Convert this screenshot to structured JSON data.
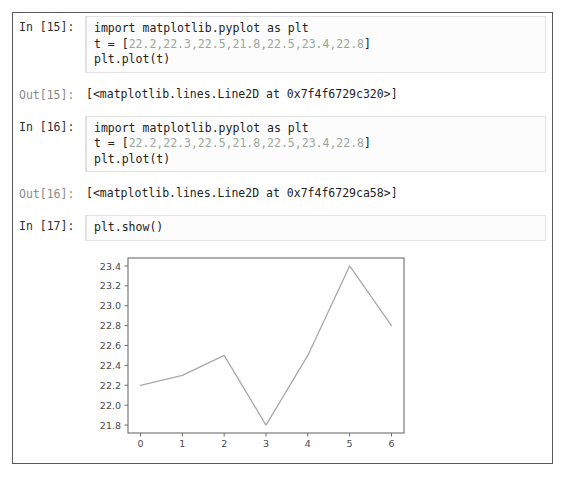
{
  "notebook": {
    "cells": [
      {
        "type": "input",
        "prompt": "In [15]:",
        "lines": [
          {
            "pre": "import matplotlib.pyplot as plt",
            "nums": "",
            "post": ""
          },
          {
            "pre": "t = [",
            "nums": "22.2,22.3,22.5,21.8,22.5,23.4,22.8",
            "post": "]"
          },
          {
            "pre": "plt.plot(t)",
            "nums": "",
            "post": ""
          }
        ]
      },
      {
        "type": "output",
        "prompt": "Out[15]:",
        "text": "[<matplotlib.lines.Line2D at 0x7f4f6729c320>]"
      },
      {
        "type": "input",
        "prompt": "In [16]:",
        "lines": [
          {
            "pre": "import matplotlib.pyplot as plt",
            "nums": "",
            "post": ""
          },
          {
            "pre": "t = [",
            "nums": "22.2,22.3,22.5,21.8,22.5,23.4,22.8",
            "post": "]"
          },
          {
            "pre": "plt.plot(t)",
            "nums": "",
            "post": ""
          }
        ]
      },
      {
        "type": "output",
        "prompt": "Out[16]:",
        "text": "[<matplotlib.lines.Line2D at 0x7f4f6729ca58>]"
      },
      {
        "type": "input",
        "prompt": "In [17]:",
        "lines": [
          {
            "pre": "plt.show()",
            "nums": "",
            "post": ""
          }
        ]
      }
    ],
    "cell_0": {
      "prompt": "In [15]:",
      "line1": "import matplotlib.pyplot as plt",
      "line2_pre": "t = [",
      "line2_nums": "22.2,22.3,22.5,21.8,22.5,23.4,22.8",
      "line2_post": "]",
      "line3": "plt.plot(t)"
    },
    "cell_1": {
      "prompt": "Out[15]:",
      "text": "[<matplotlib.lines.Line2D at 0x7f4f6729c320>]"
    },
    "cell_2": {
      "prompt": "In [16]:",
      "line1": "import matplotlib.pyplot as plt",
      "line2_pre": "t = [",
      "line2_nums": "22.2,22.3,22.5,21.8,22.5,23.4,22.8",
      "line2_post": "]",
      "line3": "plt.plot(t)"
    },
    "cell_3": {
      "prompt": "Out[16]:",
      "text": "[<matplotlib.lines.Line2D at 0x7f4f6729ca58>]"
    },
    "cell_4": {
      "prompt": "In [17]:",
      "line1": "plt.show()"
    }
  },
  "colors": {
    "border": "#5a5a5a",
    "input_bg": "#fcfcfc",
    "input_border": "#e3e3e3",
    "prompt_in": "#303030",
    "prompt_out": "#8a8a8a",
    "code_text": "#222222",
    "number_literal": "#9aa79a",
    "plot_line": "#a8a8a8",
    "axis": "#6e6e6e",
    "tick_label": "#4a4a4a"
  },
  "chart_data": {
    "type": "line",
    "title": "",
    "xlabel": "",
    "ylabel": "",
    "x": [
      0,
      1,
      2,
      3,
      4,
      5,
      6
    ],
    "values": [
      22.2,
      22.3,
      22.5,
      21.8,
      22.5,
      23.4,
      22.8
    ],
    "series": [
      {
        "name": "t",
        "values": [
          22.2,
          22.3,
          22.5,
          21.8,
          22.5,
          23.4,
          22.8
        ]
      }
    ],
    "xticks": [
      "0",
      "1",
      "2",
      "3",
      "4",
      "5",
      "6"
    ],
    "yticks": [
      "21.8",
      "22.0",
      "22.2",
      "22.4",
      "22.6",
      "22.8",
      "23.0",
      "23.2",
      "23.4"
    ],
    "xlim": [
      -0.3,
      6.3
    ],
    "ylim": [
      21.72,
      23.48
    ],
    "grid": false,
    "legend": "none",
    "line_color": "#a8a8a8"
  }
}
